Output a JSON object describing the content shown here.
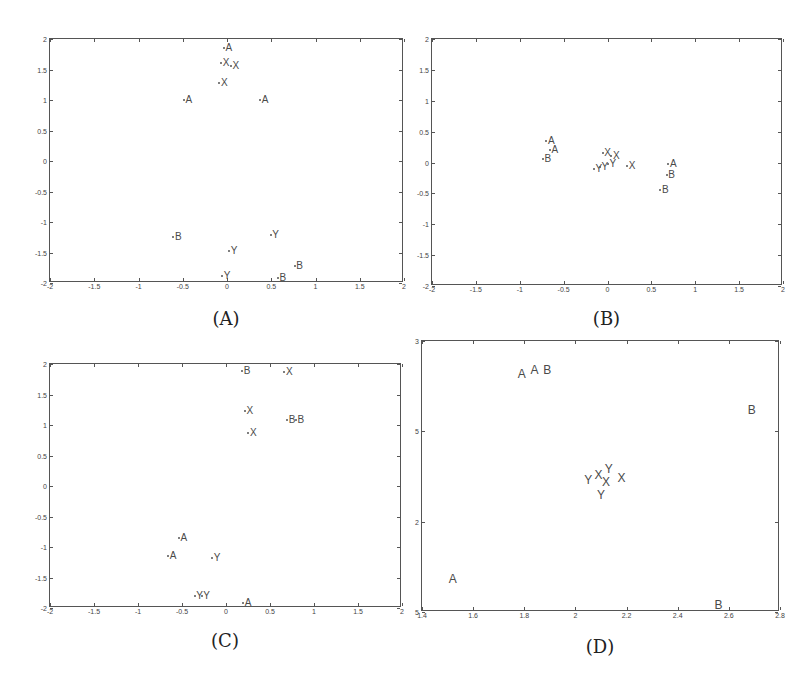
{
  "chart_data": [
    {
      "id": "A",
      "type": "scatter",
      "title": "",
      "caption": "(A)",
      "xlabel": "",
      "ylabel": "",
      "xlim": [
        -2,
        2
      ],
      "ylim": [
        -2,
        2
      ],
      "xticks": [
        "-2",
        "-1.5",
        "-1",
        "-0.5",
        "0",
        "0.5",
        "1",
        "1.5",
        "2"
      ],
      "yticks": [
        "2",
        "1.5",
        "1",
        "0.5",
        "0",
        "-0.5",
        "-1",
        "-1.5",
        "-2"
      ],
      "grid": false,
      "marker_style": "letter labels",
      "points": [
        {
          "label": "A",
          "x": 0.02,
          "y": 1.85
        },
        {
          "label": "X",
          "x": -0.01,
          "y": 1.6
        },
        {
          "label": "X",
          "x": 0.1,
          "y": 1.55
        },
        {
          "label": "X",
          "x": -0.03,
          "y": 1.28
        },
        {
          "label": "A",
          "x": -0.43,
          "y": 1.0
        },
        {
          "label": "A",
          "x": 0.43,
          "y": 1.0
        },
        {
          "label": "B",
          "x": -0.55,
          "y": -1.25
        },
        {
          "label": "Y",
          "x": 0.55,
          "y": -1.22
        },
        {
          "label": "Y",
          "x": 0.08,
          "y": -1.48
        },
        {
          "label": "B",
          "x": 0.82,
          "y": -1.72
        },
        {
          "label": "Y",
          "x": 0.0,
          "y": -1.88
        },
        {
          "label": "B",
          "x": 0.63,
          "y": -1.92
        }
      ]
    },
    {
      "id": "B",
      "type": "scatter",
      "title": "",
      "caption": "(B)",
      "xlabel": "",
      "ylabel": "",
      "xlim": [
        -2,
        2
      ],
      "ylim": [
        -2,
        2
      ],
      "xticks": [
        "-2",
        "-1.5",
        "-1",
        "-0.5",
        "0",
        "0.5",
        "1",
        "1.5",
        "2"
      ],
      "yticks": [
        "2",
        "1.5",
        "1",
        "0.5",
        "0",
        "-0.5",
        "-1",
        "-1.5",
        "-2"
      ],
      "grid": false,
      "marker_style": "letter labels",
      "points": [
        {
          "label": "A",
          "x": -0.64,
          "y": 0.35
        },
        {
          "label": "A",
          "x": -0.6,
          "y": 0.2
        },
        {
          "label": "B",
          "x": -0.68,
          "y": 0.05
        },
        {
          "label": "X",
          "x": 0.0,
          "y": 0.15
        },
        {
          "label": "X",
          "x": 0.1,
          "y": 0.1
        },
        {
          "label": "Y",
          "x": -0.1,
          "y": -0.1
        },
        {
          "label": "Y",
          "x": -0.03,
          "y": -0.08
        },
        {
          "label": "Y",
          "x": 0.06,
          "y": -0.02
        },
        {
          "label": "X",
          "x": 0.28,
          "y": -0.06
        },
        {
          "label": "A",
          "x": 0.75,
          "y": -0.02
        },
        {
          "label": "B",
          "x": 0.73,
          "y": -0.2
        },
        {
          "label": "B",
          "x": 0.66,
          "y": -0.45
        }
      ]
    },
    {
      "id": "C",
      "type": "scatter",
      "title": "",
      "caption": "(C)",
      "xlabel": "",
      "ylabel": "",
      "xlim": [
        -2,
        2
      ],
      "ylim": [
        -2,
        2
      ],
      "xticks": [
        "-2",
        "-1.5",
        "-1",
        "-0.5",
        "0",
        "0.5",
        "1",
        "1.5",
        "2"
      ],
      "yticks": [
        "2",
        "1.5",
        "1",
        "0.5",
        "0",
        "-0.5",
        "-1",
        "-1.5",
        "-2"
      ],
      "grid": false,
      "marker_style": "letter labels",
      "points": [
        {
          "label": "B",
          "x": 0.24,
          "y": 1.88
        },
        {
          "label": "X",
          "x": 0.72,
          "y": 1.87
        },
        {
          "label": "X",
          "x": 0.27,
          "y": 1.23
        },
        {
          "label": "B",
          "x": 0.75,
          "y": 1.08
        },
        {
          "label": "B",
          "x": 0.85,
          "y": 1.08
        },
        {
          "label": "X",
          "x": 0.31,
          "y": 0.87
        },
        {
          "label": "A",
          "x": -0.48,
          "y": -0.85
        },
        {
          "label": "A",
          "x": -0.6,
          "y": -1.15
        },
        {
          "label": "Y",
          "x": -0.1,
          "y": -1.18
        },
        {
          "label": "Y",
          "x": -0.3,
          "y": -1.8
        },
        {
          "label": "Y",
          "x": -0.22,
          "y": -1.8
        },
        {
          "label": "A",
          "x": 0.25,
          "y": -1.92
        }
      ]
    },
    {
      "id": "D",
      "type": "scatter",
      "title": "",
      "caption": "(D)",
      "xlabel": "",
      "ylabel": "",
      "xlim": [
        1.4,
        2.8
      ],
      "ylim": [
        1.5,
        3
      ],
      "xticks": [
        "1.4",
        "1.6",
        "1.8",
        "2",
        "2.2",
        "2.4",
        "2.6",
        "2.8"
      ],
      "yticks": [
        "3",
        "5",
        "2",
        "5"
      ],
      "ytick_positions": [
        3,
        2.5,
        2,
        1.5
      ],
      "grid": false,
      "marker_style": "letter labels",
      "points": [
        {
          "label": "A",
          "x": 1.79,
          "y": 2.82
        },
        {
          "label": "A",
          "x": 1.84,
          "y": 2.84
        },
        {
          "label": "B",
          "x": 1.89,
          "y": 2.84
        },
        {
          "label": "B",
          "x": 2.69,
          "y": 2.62
        },
        {
          "label": "X",
          "x": 2.09,
          "y": 2.26
        },
        {
          "label": "Y",
          "x": 2.13,
          "y": 2.29
        },
        {
          "label": "Y",
          "x": 2.05,
          "y": 2.23
        },
        {
          "label": "X",
          "x": 2.12,
          "y": 2.22
        },
        {
          "label": "X",
          "x": 2.18,
          "y": 2.24
        },
        {
          "label": "Y",
          "x": 2.1,
          "y": 2.15
        },
        {
          "label": "A",
          "x": 1.52,
          "y": 1.68
        },
        {
          "label": "B",
          "x": 2.56,
          "y": 1.54
        }
      ]
    }
  ],
  "layout": {
    "panels": [
      {
        "left": 49,
        "top": 38,
        "width": 354,
        "height": 244,
        "caption_y": 308
      },
      {
        "left": 431,
        "top": 38,
        "width": 351,
        "height": 247,
        "caption_y": 308
      },
      {
        "left": 49,
        "top": 363,
        "width": 352,
        "height": 244,
        "caption_y": 630
      },
      {
        "left": 421,
        "top": 340,
        "width": 358,
        "height": 271,
        "caption_y": 636
      }
    ]
  },
  "colors": {
    "frame": "#555555",
    "marker": "#4a4a4a",
    "background": "#ffffff"
  }
}
